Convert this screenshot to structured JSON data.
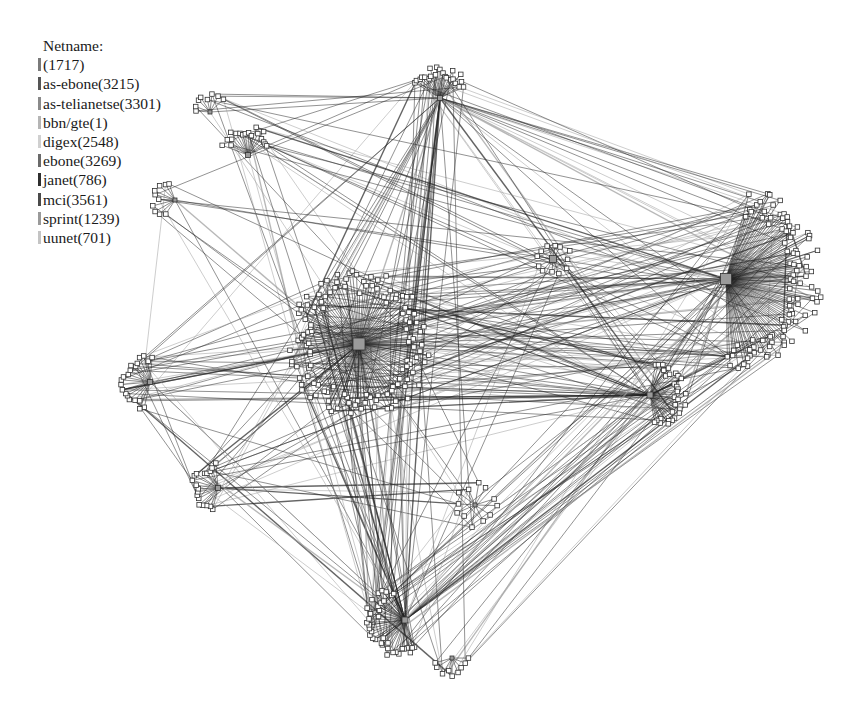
{
  "legend": {
    "title": "Netname:",
    "items": [
      {
        "label": "(1717)",
        "color": "#7a7a7a"
      },
      {
        "label": "as-ebone(3215)",
        "color": "#555555"
      },
      {
        "label": "as-telianetse(3301)",
        "color": "#8a8a8a"
      },
      {
        "label": "bbn/gte(1)",
        "color": "#b5b5b5"
      },
      {
        "label": "digex(2548)",
        "color": "#d0d0d0"
      },
      {
        "label": "ebone(3269)",
        "color": "#6a6a6a"
      },
      {
        "label": "janet(786)",
        "color": "#2e2e2e"
      },
      {
        "label": "mci(3561)",
        "color": "#4a4a4a"
      },
      {
        "label": "sprint(1239)",
        "color": "#9a9a9a"
      },
      {
        "label": "uunet(701)",
        "color": "#c4c4c4"
      }
    ]
  },
  "graph": {
    "edge_color": "#222222",
    "node_fill": "#ffffff",
    "node_stroke": "#333333",
    "hub_fill": "#9a9a9a",
    "hubs": [
      {
        "id": "center",
        "x": 359,
        "y": 344,
        "size": 12,
        "leaves": 120,
        "r": 70,
        "start": 0,
        "end": 360
      },
      {
        "id": "east",
        "x": 726,
        "y": 279,
        "size": 11,
        "leaves": 95,
        "r": 92,
        "start": -75,
        "end": 90
      },
      {
        "id": "top",
        "x": 440,
        "y": 98,
        "size": 5,
        "leaves": 22,
        "r": 30,
        "start": -150,
        "end": -20
      },
      {
        "id": "mid-east",
        "x": 650,
        "y": 395,
        "size": 6,
        "leaves": 30,
        "r": 35,
        "start": -80,
        "end": 85
      },
      {
        "id": "bottom",
        "x": 405,
        "y": 620,
        "size": 6,
        "leaves": 36,
        "r": 38,
        "start": 70,
        "end": 250
      },
      {
        "id": "nw",
        "x": 248,
        "y": 155,
        "size": 5,
        "leaves": 18,
        "r": 28,
        "start": -160,
        "end": -20
      },
      {
        "id": "west",
        "x": 150,
        "y": 382,
        "size": 5,
        "leaves": 20,
        "r": 28,
        "start": 100,
        "end": 280
      },
      {
        "id": "sw",
        "x": 218,
        "y": 488,
        "size": 5,
        "leaves": 18,
        "r": 26,
        "start": 100,
        "end": 270
      },
      {
        "id": "ne-small",
        "x": 553,
        "y": 259,
        "size": 7,
        "leaves": 12,
        "r": 18,
        "start": 0,
        "end": 360
      },
      {
        "id": "w-small",
        "x": 175,
        "y": 200,
        "size": 4,
        "leaves": 10,
        "r": 22,
        "start": 120,
        "end": 260
      },
      {
        "id": "s-mid",
        "x": 475,
        "y": 505,
        "size": 4,
        "leaves": 12,
        "r": 22,
        "start": 0,
        "end": 360
      },
      {
        "id": "bottom-right",
        "x": 452,
        "y": 658,
        "size": 4,
        "leaves": 9,
        "r": 18,
        "start": 0,
        "end": 180
      },
      {
        "id": "far-nw",
        "x": 210,
        "y": 112,
        "size": 4,
        "leaves": 8,
        "r": 18,
        "start": 180,
        "end": 330
      }
    ],
    "cross_links": 420,
    "seed": 7
  }
}
